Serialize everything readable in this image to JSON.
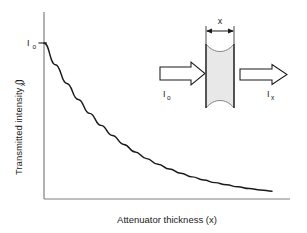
{
  "figure": {
    "axes": {
      "y_axis_title": "Transmitted intensity (I",
      "y_axis_title_sub": "x",
      "y_axis_title_close": ")",
      "x_axis_title": "Attenuator thickness (x)",
      "y_tick_label": "I",
      "y_tick_sub": "o"
    },
    "inset": {
      "dimension_label": "x",
      "incident_label": "I",
      "incident_sub": "o",
      "transmitted_label": "I",
      "transmitted_sub": "x",
      "slab_fill_color": "#e8e8e8",
      "slab_edge_color": "#555555",
      "arrow_outline_color": "#1a1a1a",
      "arrow_fill_color": "#ffffff"
    },
    "style": {
      "axis_color": "#808080",
      "curve_color": "#1a1a1a",
      "background_color": "#ffffff"
    }
  },
  "chart_data": {
    "type": "line",
    "title": "",
    "xlabel": "Attenuator thickness (x)",
    "ylabel": "Transmitted intensity (Ix)",
    "grid": false,
    "legend": null,
    "annotations": [
      {
        "text": "Io",
        "role": "y-axis tick at initial intensity",
        "x": 0,
        "y": 1.0
      },
      {
        "text": "x",
        "role": "inset slab thickness dimension"
      },
      {
        "text": "Io",
        "role": "inset incident beam arrow label"
      },
      {
        "text": "Ix",
        "role": "inset transmitted beam arrow label"
      }
    ],
    "xlim": [
      0,
      1
    ],
    "ylim": [
      0,
      1.08
    ],
    "tick_labels": {
      "x": [],
      "y": [
        "Io"
      ]
    },
    "series": [
      {
        "name": "Exponential attenuation  I = Io*exp(-mu*x)",
        "x": [
          0.0,
          0.05,
          0.1,
          0.15,
          0.2,
          0.25,
          0.3,
          0.35,
          0.4,
          0.45,
          0.5,
          0.55,
          0.6,
          0.65,
          0.7,
          0.75,
          0.8,
          0.85,
          0.9,
          0.95,
          1.0
        ],
        "y": [
          1.0,
          0.861,
          0.741,
          0.638,
          0.549,
          0.472,
          0.407,
          0.35,
          0.301,
          0.259,
          0.223,
          0.192,
          0.165,
          0.142,
          0.122,
          0.105,
          0.091,
          0.078,
          0.067,
          0.058,
          0.05
        ]
      }
    ]
  }
}
